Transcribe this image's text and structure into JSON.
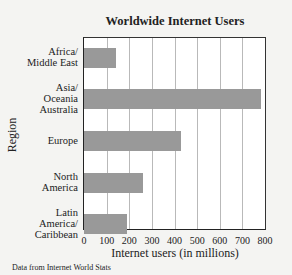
{
  "chart_data": {
    "type": "bar",
    "orientation": "horizontal",
    "title": "Worldwide Internet Users",
    "xlabel": "Internet users (in millions)",
    "ylabel": "Region",
    "categories": [
      "Africa/ Middle East",
      "Asia/ Oceania Australia",
      "Europe",
      "North America",
      "Latin America/ Caribbean"
    ],
    "values": [
      143,
      783,
      427,
      261,
      189
    ],
    "xlim": [
      0,
      800
    ],
    "xticks": [
      "0",
      "100",
      "200",
      "300",
      "400",
      "500",
      "600",
      "700",
      "800"
    ],
    "grid": "vertical",
    "legend": null,
    "bar_color": "#999999",
    "annotation": "Data from Internet World Stats"
  },
  "labels": {
    "title": "Worldwide Internet Users",
    "xlabel": "Internet users (in millions)",
    "ylabel": "Region",
    "source": "Data from Internet World Stats",
    "cat0": [
      "Africa/",
      "Middle East"
    ],
    "cat1": [
      "Asia/",
      "Oceania",
      "Australia"
    ],
    "cat2": [
      "Europe"
    ],
    "cat3": [
      "North",
      "America"
    ],
    "cat4": [
      "Latin",
      "America/",
      "Caribbean"
    ]
  }
}
